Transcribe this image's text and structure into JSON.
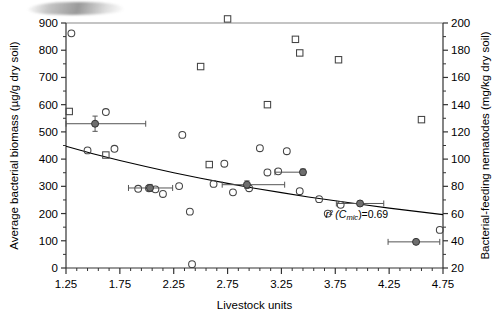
{
  "chart_data": {
    "type": "scatter",
    "title": "",
    "xlabel": "Livestock units",
    "ylabel": "Average bacterial biomass (µg/g dry soil)",
    "y2label": "Bacterial-feeding nematodes (mg/kg dry soil)",
    "xlim": [
      1.25,
      4.75
    ],
    "ylim": [
      0,
      900
    ],
    "y2lim": [
      20,
      200
    ],
    "xticks": [
      "1.25",
      "1.75",
      "2.25",
      "2.75",
      "3.25",
      "3.75",
      "4.25",
      "4.75"
    ],
    "xtick_values": [
      1.25,
      1.75,
      2.25,
      2.75,
      3.25,
      3.75,
      4.25,
      4.75
    ],
    "xminor_step": 0.1,
    "yticks": [
      "0",
      "100",
      "200",
      "300",
      "400",
      "500",
      "600",
      "700",
      "800",
      "900"
    ],
    "ytick_values": [
      0,
      100,
      200,
      300,
      400,
      500,
      600,
      700,
      800,
      900
    ],
    "y2ticks": [
      "20",
      "40",
      "60",
      "80",
      "100",
      "120",
      "140",
      "160",
      "180",
      "200"
    ],
    "y2tick_values": [
      20,
      40,
      60,
      80,
      100,
      120,
      140,
      160,
      180,
      200
    ],
    "grid": false,
    "legend": "none",
    "annotations": [
      {
        "name": "r-squared-annotation",
        "text": "r² (C",
        "sub": "mic",
        "text2": ")=0.69",
        "x": 3.95,
        "y": 185
      }
    ],
    "series": [
      {
        "name": "Average bacterial biomass",
        "marker": "open-circle",
        "axis": "left",
        "color": "#444444",
        "points": [
          [
            1.3,
            862
          ],
          [
            1.45,
            432
          ],
          [
            1.62,
            573
          ],
          [
            1.7,
            438
          ],
          [
            1.92,
            291
          ],
          [
            2.02,
            293
          ],
          [
            2.08,
            289
          ],
          [
            2.15,
            272
          ],
          [
            2.3,
            301
          ],
          [
            2.33,
            489
          ],
          [
            2.4,
            207
          ],
          [
            2.42,
            14
          ],
          [
            2.62,
            309
          ],
          [
            2.72,
            383
          ],
          [
            2.8,
            278
          ],
          [
            2.95,
            293
          ],
          [
            3.05,
            440
          ],
          [
            3.12,
            351
          ],
          [
            3.22,
            355
          ],
          [
            3.3,
            429
          ],
          [
            3.42,
            282
          ],
          [
            3.6,
            253
          ],
          [
            3.68,
            200
          ],
          [
            3.8,
            232
          ],
          [
            4.72,
            140
          ]
        ]
      },
      {
        "name": "Bacterial-feeding nematodes",
        "marker": "open-square",
        "axis": "right",
        "color": "#444444",
        "points": [
          [
            1.28,
            135
          ],
          [
            1.5,
            371
          ],
          [
            1.62,
            103
          ],
          [
            1.92,
            249
          ],
          [
            2.02,
            247
          ],
          [
            2.12,
            236
          ],
          [
            2.2,
            383
          ],
          [
            2.28,
            347
          ],
          [
            2.33,
            489
          ],
          [
            2.38,
            253
          ],
          [
            2.5,
            168
          ],
          [
            2.58,
            96
          ],
          [
            2.75,
            203
          ],
          [
            2.88,
            343
          ],
          [
            3.02,
            383
          ],
          [
            3.12,
            140
          ],
          [
            3.3,
            381
          ],
          [
            3.38,
            188
          ],
          [
            3.42,
            178
          ],
          [
            3.55,
            251
          ],
          [
            3.78,
            173
          ],
          [
            4.02,
            239
          ],
          [
            4.55,
            129
          ],
          [
            4.68,
            248
          ]
        ]
      },
      {
        "name": "Group means (with SE bars)",
        "marker": "filled-circle-errorbar",
        "axis": "left",
        "color": "#6e6e6e",
        "points": [
          {
            "x": 1.52,
            "y": 530,
            "xerr_low": 0.27,
            "xerr_high": 0.47,
            "yerr": 28
          },
          {
            "x": 2.03,
            "y": 294,
            "xerr_low": 0.2,
            "xerr_high": 0.21,
            "yerr": 13
          },
          {
            "x": 2.93,
            "y": 306,
            "xerr_low": 0.23,
            "xerr_high": 0.35,
            "yerr": 14
          },
          {
            "x": 3.45,
            "y": 352,
            "xerr_low": 0.26,
            "xerr_high": 0.0,
            "yerr": 12
          },
          {
            "x": 3.98,
            "y": 237,
            "xerr_low": 0.22,
            "xerr_high": 0.22,
            "yerr": 8
          },
          {
            "x": 4.5,
            "y": 96,
            "xerr_low": 0.26,
            "xerr_high": 0.22,
            "yerr": 0
          }
        ]
      },
      {
        "name": "Regression curve (Cmic)",
        "marker": "line",
        "axis": "left",
        "color": "#000000",
        "curve": [
          [
            1.25,
            447
          ],
          [
            1.5,
            420
          ],
          [
            1.75,
            395
          ],
          [
            2.0,
            372
          ],
          [
            2.25,
            350
          ],
          [
            2.5,
            330
          ],
          [
            2.75,
            311
          ],
          [
            3.0,
            293
          ],
          [
            3.25,
            277
          ],
          [
            3.5,
            261
          ],
          [
            3.75,
            247
          ],
          [
            4.0,
            233
          ],
          [
            4.25,
            220
          ],
          [
            4.5,
            208
          ],
          [
            4.75,
            196
          ]
        ]
      }
    ]
  }
}
